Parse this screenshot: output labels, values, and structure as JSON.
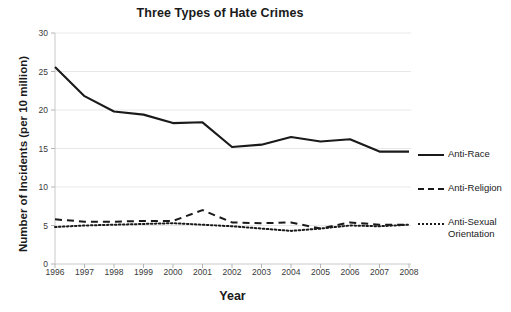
{
  "chart_data": {
    "type": "line",
    "title": "Three Types of Hate Crimes",
    "xlabel": "Year",
    "ylabel": "Number of Incidents (per 10 million)",
    "categories": [
      "1996",
      "1997",
      "1998",
      "1999",
      "2000",
      "2001",
      "2002",
      "2003",
      "2004",
      "2005",
      "2006",
      "2007",
      "2008"
    ],
    "xticklabels": [
      "1996",
      "1997",
      "1998",
      "1999",
      "2000",
      "2001",
      "2002",
      "2003",
      "2004",
      "2005",
      "2006",
      "2007",
      "2008"
    ],
    "yticklabels": [
      "0",
      "5",
      "10",
      "15",
      "20",
      "25",
      "30"
    ],
    "ylim": [
      0,
      30
    ],
    "ytick_step": 5,
    "grid": "horizontal",
    "legend_position": "right",
    "series": [
      {
        "name": "Anti-Race",
        "style": "solid",
        "color": "#1a1a1a",
        "values": [
          25.6,
          21.8,
          19.8,
          19.4,
          18.3,
          18.4,
          15.2,
          15.5,
          16.5,
          15.9,
          16.2,
          14.6,
          14.6
        ]
      },
      {
        "name": "Anti-Religion",
        "style": "dashed",
        "color": "#1a1a1a",
        "values": [
          5.8,
          5.5,
          5.5,
          5.6,
          5.6,
          7.0,
          5.4,
          5.3,
          5.4,
          4.6,
          5.4,
          5.1,
          5.1
        ]
      },
      {
        "name": "Anti-Sexual Orientation",
        "style": "dotted",
        "color": "#1a1a1a",
        "values": [
          4.8,
          5.0,
          5.1,
          5.2,
          5.3,
          5.1,
          4.9,
          4.6,
          4.3,
          4.6,
          5.0,
          4.9,
          5.1
        ]
      }
    ]
  },
  "legend": {
    "items": [
      {
        "label": "Anti-Race",
        "swatch": "solid-line-icon"
      },
      {
        "label": "Anti-Religion",
        "swatch": "dashed-line-icon"
      },
      {
        "label": "Anti-Sexual Orientation",
        "swatch": "dotted-line-icon"
      }
    ]
  }
}
